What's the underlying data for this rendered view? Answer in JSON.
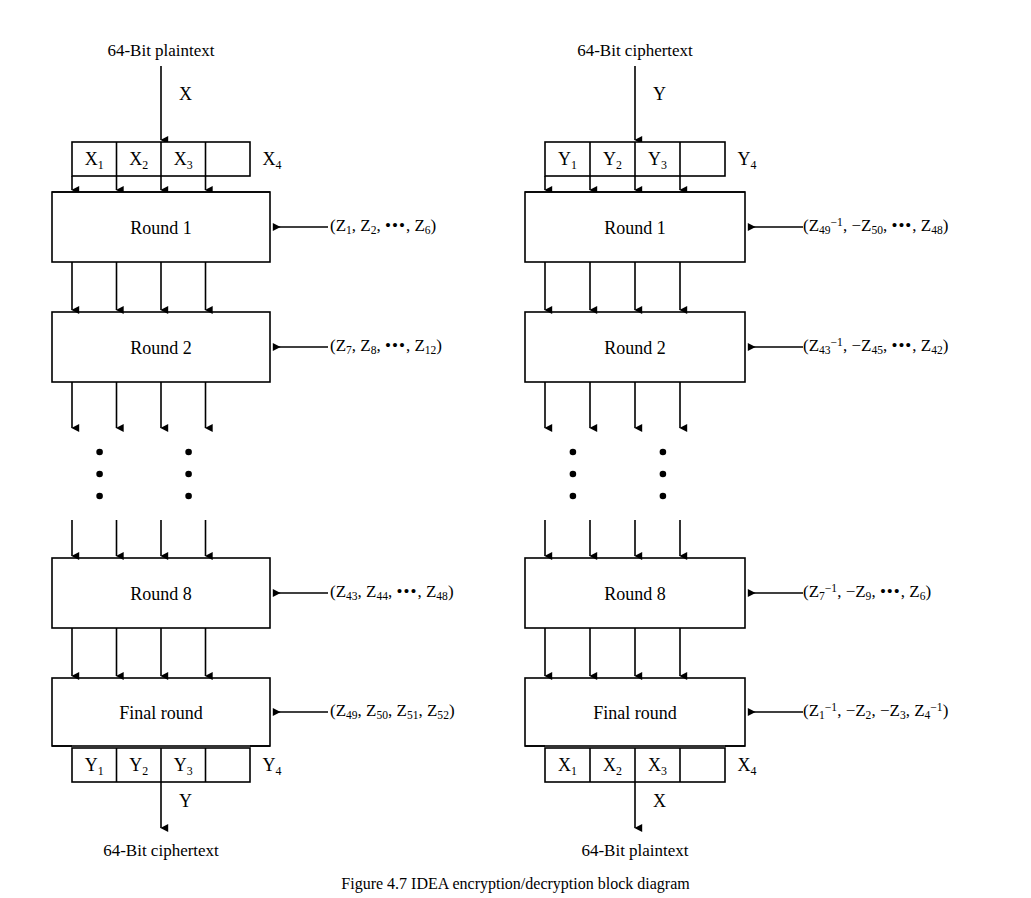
{
  "figure": {
    "caption": "Figure 4.7  IDEA encryption/decryption block diagram",
    "line_color": "#000000",
    "background_color": "#ffffff"
  },
  "columns": [
    {
      "id": "encryption",
      "top_text": "64-Bit plaintext",
      "top_flow_var": "X",
      "top_subblocks": [
        "X",
        "X",
        "X",
        "X"
      ],
      "top_subblock_subs": [
        "1",
        "2",
        "3",
        "4"
      ],
      "rounds": [
        {
          "label": "Round 1"
        },
        {
          "label": "Round 2"
        },
        {
          "label": "Round 8"
        },
        {
          "label": "Final round"
        }
      ],
      "keys": [
        {
          "open": "(",
          "items": [
            {
              "base": "Z",
              "sub": "1"
            },
            {
              "base": "Z",
              "sub": "2"
            }
          ],
          "ellipsis": "•••",
          "tail": {
            "base": "Z",
            "sub": "6"
          },
          "close": ")"
        },
        {
          "open": "(",
          "items": [
            {
              "base": "Z",
              "sub": "7"
            },
            {
              "base": "Z",
              "sub": "8"
            }
          ],
          "ellipsis": "•••",
          "tail": {
            "base": "Z",
            "sub": "12"
          },
          "close": ")"
        },
        {
          "open": "(",
          "items": [
            {
              "base": "Z",
              "sub": "43"
            },
            {
              "base": "Z",
              "sub": "44"
            }
          ],
          "ellipsis": "•••",
          "tail": {
            "base": "Z",
            "sub": "48"
          },
          "close": ")"
        },
        {
          "open": "(",
          "items": [
            {
              "base": "Z",
              "sub": "49"
            },
            {
              "base": "Z",
              "sub": "50"
            },
            {
              "base": "Z",
              "sub": "51"
            },
            {
              "base": "Z",
              "sub": "52"
            }
          ],
          "ellipsis": "",
          "tail": null,
          "close": ")"
        }
      ],
      "bottom_subblocks": [
        "Y",
        "Y",
        "Y",
        "Y"
      ],
      "bottom_subblock_subs": [
        "1",
        "2",
        "3",
        "4"
      ],
      "bottom_flow_var": "Y",
      "bottom_text": "64-Bit ciphertext"
    },
    {
      "id": "decryption",
      "top_text": "64-Bit ciphertext",
      "top_flow_var": "Y",
      "top_subblocks": [
        "Y",
        "Y",
        "Y",
        "Y"
      ],
      "top_subblock_subs": [
        "1",
        "2",
        "3",
        "4"
      ],
      "rounds": [
        {
          "label": "Round 1"
        },
        {
          "label": "Round 2"
        },
        {
          "label": "Round 8"
        },
        {
          "label": "Final round"
        }
      ],
      "keys": [
        {
          "open": "(",
          "items": [
            {
              "base": "Z",
              "sub": "49",
              "sup": "−1"
            },
            {
              "base": "Z",
              "sub": "50",
              "sign": "−"
            }
          ],
          "ellipsis": "•••",
          "tail": {
            "base": "Z",
            "sub": "48"
          },
          "close": ")"
        },
        {
          "open": "(",
          "items": [
            {
              "base": "Z",
              "sub": "43",
              "sup": "−1"
            },
            {
              "base": "Z",
              "sub": "45",
              "sign": "−"
            }
          ],
          "ellipsis": "•••",
          "tail": {
            "base": "Z",
            "sub": "42"
          },
          "close": ")"
        },
        {
          "open": "(",
          "items": [
            {
              "base": "Z",
              "sub": "7",
              "sup": "−1"
            },
            {
              "base": "Z",
              "sub": "9",
              "sign": "−"
            }
          ],
          "ellipsis": "•••",
          "tail": {
            "base": "Z",
            "sub": "6"
          },
          "close": ")"
        },
        {
          "open": "(",
          "items": [
            {
              "base": "Z",
              "sub": "1",
              "sup": "−1"
            },
            {
              "base": "Z",
              "sub": "2",
              "sign": "−"
            },
            {
              "base": "Z",
              "sub": "3",
              "sign": "−"
            },
            {
              "base": "Z",
              "sub": "4",
              "sup": "−1"
            }
          ],
          "ellipsis": "",
          "tail": null,
          "close": ")"
        }
      ],
      "bottom_subblocks": [
        "X",
        "X",
        "X",
        "X"
      ],
      "bottom_subblock_subs": [
        "1",
        "2",
        "3",
        "4"
      ],
      "bottom_flow_var": "X",
      "bottom_text": "64-Bit plaintext"
    }
  ],
  "ellipsis_marks": {
    "glyph": "•",
    "count_per_mark": 3,
    "description": "vertical dots indicating omitted rounds 3-7"
  }
}
